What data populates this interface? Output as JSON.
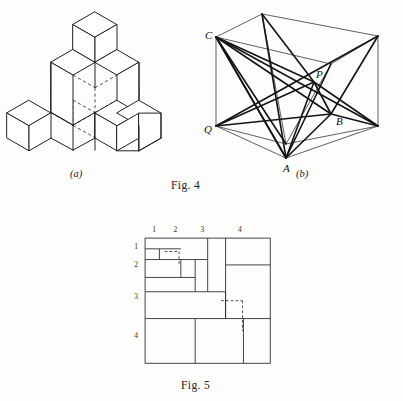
{
  "page": {
    "background": "#fdfdfb",
    "ink": "#222222"
  },
  "captions": {
    "fig4": "Fig. 4",
    "fig5": "Fig. 5",
    "sub_a": "(a)",
    "sub_b": "(b)"
  },
  "figure_4a": {
    "name": "isometric-cube-stack",
    "description": "Isometric drawing of a stack of unit cubes with hidden edges shown dashed",
    "projection": "isometric",
    "unit": {
      "dx": 22,
      "dy": 12.7,
      "dz": 25
    },
    "origin": {
      "x": 95,
      "y": 150
    },
    "cubes": [
      {
        "i": 0,
        "j": 0,
        "k": 0
      },
      {
        "i": 1,
        "j": 0,
        "k": 0
      },
      {
        "i": 0,
        "j": 1,
        "k": 0
      },
      {
        "i": 1,
        "j": 1,
        "k": 0
      },
      {
        "i": -1,
        "j": 1,
        "k": 0
      },
      {
        "i": 1,
        "j": -1,
        "k": 0
      },
      {
        "i": 0,
        "j": 0,
        "k": 1
      },
      {
        "i": 1,
        "j": 0,
        "k": 1
      },
      {
        "i": 0,
        "j": 1,
        "k": 1
      },
      {
        "i": 1,
        "j": 1,
        "k": 1
      },
      {
        "i": 0,
        "j": 0,
        "k": 2
      }
    ]
  },
  "figure_4b": {
    "name": "labeled-parallelepiped",
    "description": "Oblique drawing of a rectangular box with internal diagonals drawn from the labelled vertices",
    "vertices": {
      "C": {
        "x": 18,
        "y": 33,
        "label": "C",
        "label_dx": -11,
        "label_dy": 2
      },
      "Q": {
        "x": 18,
        "y": 122,
        "label": "Q",
        "label_dx": -12,
        "label_dy": 7
      },
      "A": {
        "x": 88,
        "y": 154,
        "label": "A",
        "label_dx": -3,
        "label_dy": 14
      },
      "B": {
        "x": 133,
        "y": 110,
        "label": "B",
        "label_dx": 5,
        "label_dy": 11
      },
      "P": {
        "x": 116,
        "y": 78,
        "label": "P",
        "label_dx": 2,
        "label_dy": -4
      },
      "T1": {
        "x": 64,
        "y": 10,
        "label": "",
        "label_dx": 0,
        "label_dy": 0
      },
      "T2": {
        "x": 180,
        "y": 32,
        "label": "",
        "label_dx": 0,
        "label_dy": 0
      },
      "T3": {
        "x": 133,
        "y": 60,
        "label": "",
        "label_dx": 0,
        "label_dy": 0
      },
      "R1": {
        "x": 180,
        "y": 122,
        "label": "",
        "label_dx": 0,
        "label_dy": 0
      },
      "R2": {
        "x": 88,
        "y": 140,
        "label": "",
        "label_dx": 0,
        "label_dy": 0
      }
    },
    "box_edges": [
      [
        "C",
        "T1"
      ],
      [
        "T1",
        "T2"
      ],
      [
        "T2",
        "R1"
      ],
      [
        "C",
        "Q"
      ],
      [
        "Q",
        "A"
      ],
      [
        "A",
        "R1"
      ],
      [
        "C",
        "T3"
      ],
      [
        "T3",
        "T2"
      ],
      [
        "T3",
        "R2"
      ],
      [
        "Q",
        "R2"
      ],
      [
        "R2",
        "R1"
      ],
      [
        "T1",
        "R2"
      ]
    ],
    "diagonals": [
      [
        "C",
        "A"
      ],
      [
        "C",
        "B"
      ],
      [
        "C",
        "P"
      ],
      [
        "C",
        "R1"
      ],
      [
        "C",
        "R2"
      ],
      [
        "A",
        "P"
      ],
      [
        "A",
        "B"
      ],
      [
        "A",
        "T1"
      ],
      [
        "A",
        "T3"
      ],
      [
        "A",
        "C"
      ],
      [
        "Q",
        "B"
      ],
      [
        "Q",
        "P"
      ],
      [
        "Q",
        "T2"
      ],
      [
        "P",
        "B"
      ],
      [
        "P",
        "T1"
      ],
      [
        "P",
        "R1"
      ],
      [
        "B",
        "T2"
      ],
      [
        "B",
        "R1"
      ]
    ]
  },
  "figure_5": {
    "name": "squared-square-dissection",
    "description": "A square subdivided into unequal squares, with row and column index labels and two dashed sub-squares",
    "outer_square": {
      "x": 18,
      "y": 18,
      "size": 140
    },
    "column_labels": [
      {
        "text": "1",
        "x": 28,
        "y": 11
      },
      {
        "text": "2",
        "x": 52,
        "y": 11
      },
      {
        "text": "3",
        "x": 82,
        "y": 11
      },
      {
        "text": "4",
        "x": 124,
        "y": 11
      }
    ],
    "row_labels": [
      {
        "text": "1",
        "x": 8,
        "y": 30
      },
      {
        "text": "2",
        "x": 8,
        "y": 50
      },
      {
        "text": "3",
        "x": 8,
        "y": 86
      },
      {
        "text": "4",
        "x": 8,
        "y": 130
      }
    ],
    "solid_segments": [
      [
        18,
        42,
        88,
        42
      ],
      [
        18,
        62,
        74,
        62
      ],
      [
        88,
        18,
        88,
        78
      ],
      [
        18,
        78,
        108,
        78
      ],
      [
        108,
        18,
        108,
        18
      ],
      [
        108,
        48,
        158,
        48
      ],
      [
        108,
        18,
        108,
        108
      ],
      [
        74,
        42,
        74,
        78
      ],
      [
        58,
        42,
        58,
        62
      ],
      [
        18,
        108,
        158,
        108
      ],
      [
        74,
        108,
        74,
        158
      ],
      [
        108,
        78,
        108,
        108
      ],
      [
        128,
        108,
        128,
        158
      ],
      [
        34,
        30,
        34,
        42
      ],
      [
        18,
        30,
        34,
        30
      ],
      [
        34,
        30,
        58,
        30
      ]
    ],
    "dashed_segments": [
      [
        40,
        33,
        56,
        33
      ],
      [
        56,
        33,
        56,
        49
      ],
      [
        103,
        88,
        127,
        88
      ],
      [
        127,
        88,
        127,
        122
      ]
    ]
  }
}
